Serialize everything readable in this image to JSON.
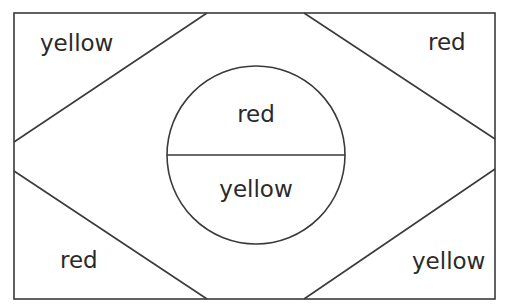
{
  "diagram": {
    "regions": {
      "top_left": {
        "label": "yellow"
      },
      "top_right": {
        "label": "red"
      },
      "bottom_left": {
        "label": "red"
      },
      "bottom_right": {
        "label": "yellow"
      },
      "circle_top": {
        "label": "red"
      },
      "circle_bottom": {
        "label": "yellow"
      }
    },
    "colors": {
      "line": "#3a3a3a",
      "text": "#2a2a2a",
      "background": "#ffffff"
    }
  }
}
